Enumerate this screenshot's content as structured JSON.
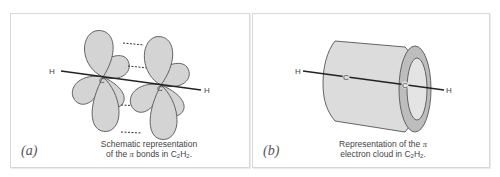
{
  "figure": {
    "panels": [
      {
        "id": "a",
        "label": "(a)",
        "caption_line1": "Schematic representation",
        "caption_line2_prefix": "of the ",
        "caption_line2_symbol": "π",
        "caption_line2_mid": " bonds in C",
        "caption_sub1": "2",
        "caption_mid2": "H",
        "caption_sub2": "2",
        "caption_end": ".",
        "atoms": [
          "H",
          "C",
          "C",
          "H"
        ],
        "description": "Two carbon atoms each with two pairs of p-orbital lobes; dashed lines indicate overlap forming pi bonds"
      },
      {
        "id": "b",
        "label": "(b)",
        "caption_line1_prefix": "Representation of the ",
        "caption_line1_symbol": "π",
        "caption_line2_prefix": "electron cloud in C",
        "caption_sub1": "2",
        "caption_mid2": "H",
        "caption_sub2": "2",
        "caption_end": ".",
        "atoms": [
          "H",
          "C",
          "C",
          "H"
        ],
        "description": "Cylindrical pi electron cloud surrounding the H-C-C-H axis"
      }
    ],
    "colors": {
      "lobe_fill": "#d4d4d4",
      "lobe_stroke": "#555555",
      "bond_line": "#222222",
      "cylinder_fill": "#dcdcdc",
      "cylinder_rim": "#bdbdbd",
      "border": "#d8d8d8"
    }
  }
}
